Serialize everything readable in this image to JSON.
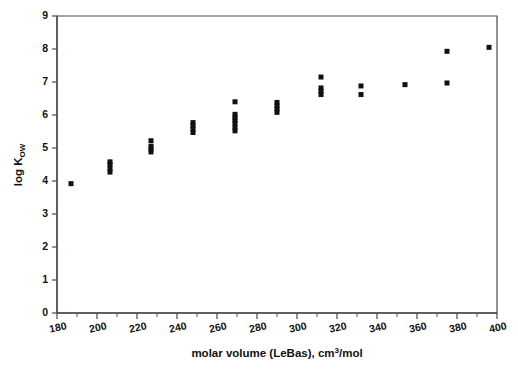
{
  "chart_data": {
    "type": "scatter",
    "title": "",
    "xlabel": "molar volume (LeBas), cm³/mol",
    "ylabel": "log K_OW",
    "ylabel_main": "log K",
    "ylabel_sub": "OW",
    "xlabel_pre": "molar volume (LeBas), cm",
    "xlabel_sup": "3",
    "xlabel_post": "/mol",
    "xlim": [
      180,
      400
    ],
    "ylim": [
      0,
      9
    ],
    "xticks": [
      180,
      200,
      220,
      240,
      260,
      280,
      300,
      320,
      340,
      360,
      380,
      400
    ],
    "yticks": [
      0,
      1,
      2,
      3,
      4,
      5,
      6,
      7,
      8,
      9
    ],
    "x_minor_step": 10,
    "grid": false,
    "legend": false,
    "marker": "square",
    "marker_color": "#111111",
    "marker_size": 5,
    "series": [
      {
        "name": "log Kow vs molar volume",
        "points": [
          [
            187.0,
            3.92
          ],
          [
            206.5,
            4.58
          ],
          [
            206.5,
            4.5
          ],
          [
            206.5,
            4.37
          ],
          [
            206.5,
            4.27
          ],
          [
            227.0,
            5.22
          ],
          [
            227.0,
            5.05
          ],
          [
            227.0,
            4.97
          ],
          [
            227.0,
            4.88
          ],
          [
            248.0,
            5.77
          ],
          [
            248.0,
            5.68
          ],
          [
            248.0,
            5.58
          ],
          [
            248.0,
            5.47
          ],
          [
            269.0,
            6.4
          ],
          [
            269.0,
            6.02
          ],
          [
            269.0,
            5.93
          ],
          [
            269.0,
            5.84
          ],
          [
            269.0,
            5.75
          ],
          [
            269.0,
            5.63
          ],
          [
            269.0,
            5.52
          ],
          [
            290.0,
            6.38
          ],
          [
            290.0,
            6.28
          ],
          [
            290.0,
            6.18
          ],
          [
            290.0,
            6.08
          ],
          [
            312.0,
            7.15
          ],
          [
            312.0,
            6.82
          ],
          [
            312.0,
            6.72
          ],
          [
            312.0,
            6.62
          ],
          [
            332.0,
            6.88
          ],
          [
            332.0,
            6.62
          ],
          [
            354.0,
            6.92
          ],
          [
            375.0,
            7.93
          ],
          [
            375.0,
            6.97
          ],
          [
            396.0,
            8.05
          ]
        ]
      }
    ]
  },
  "geometry": {
    "plot_left": 57,
    "plot_right": 497,
    "plot_top": 16,
    "plot_bottom": 313
  }
}
